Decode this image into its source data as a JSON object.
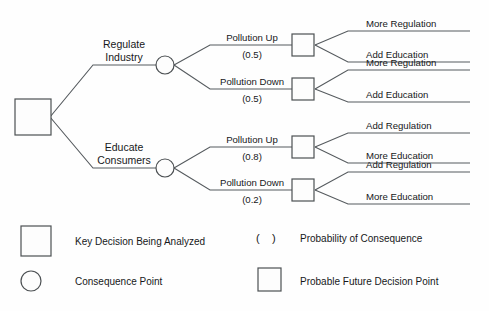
{
  "diagram": {
    "type": "decision-tree",
    "root": {
      "symbol": "square",
      "meaning": "Key Decision Being Analyzed"
    },
    "decisions": [
      {
        "id": "regulate-industry",
        "label_line1": "Regulate",
        "label_line2": "Industry",
        "consequences": [
          {
            "id": "regulate-pollution-up",
            "label": "Pollution Up",
            "probability": "(0.5)",
            "probability_value": 0.5,
            "future_decisions": [
              {
                "id": "regulate-up-more-regulation",
                "label": "More Regulation"
              },
              {
                "id": "regulate-up-add-education",
                "label": "Add Education"
              }
            ]
          },
          {
            "id": "regulate-pollution-down",
            "label": "Pollution Down",
            "probability": "(0.5)",
            "probability_value": 0.5,
            "future_decisions": [
              {
                "id": "regulate-down-more-regulation",
                "label": "More Regulation"
              },
              {
                "id": "regulate-down-add-education",
                "label": "Add Education"
              }
            ]
          }
        ]
      },
      {
        "id": "educate-consumers",
        "label_line1": "Educate",
        "label_line2": "Consumers",
        "consequences": [
          {
            "id": "educate-pollution-up",
            "label": "Pollution Up",
            "probability": "(0.8)",
            "probability_value": 0.8,
            "future_decisions": [
              {
                "id": "educate-up-add-regulation",
                "label": "Add Regulation"
              },
              {
                "id": "educate-up-more-education",
                "label": "More Education"
              }
            ]
          },
          {
            "id": "educate-pollution-down",
            "label": "Pollution Down",
            "probability": "(0.2)",
            "probability_value": 0.2,
            "future_decisions": [
              {
                "id": "educate-down-add-regulation",
                "label": "Add Regulation"
              },
              {
                "id": "educate-down-more-education",
                "label": "More Education"
              }
            ]
          }
        ]
      }
    ]
  },
  "legend": {
    "items": [
      {
        "id": "key-decision",
        "symbol": "large-square",
        "label": "Key Decision Being Analyzed"
      },
      {
        "id": "probability",
        "symbol": "parentheses",
        "symbol_text": "(    )",
        "label": "Probability of Consequence"
      },
      {
        "id": "consequence-point",
        "symbol": "circle",
        "label": "Consequence Point"
      },
      {
        "id": "future-decision",
        "symbol": "small-square",
        "label": "Probable Future Decision Point"
      }
    ]
  },
  "colors": {
    "stroke": "#555a5e",
    "node_stroke": "#4c5053",
    "text": "#16181a",
    "background": "#fefefe",
    "node_fill": "#fdfdfd"
  }
}
